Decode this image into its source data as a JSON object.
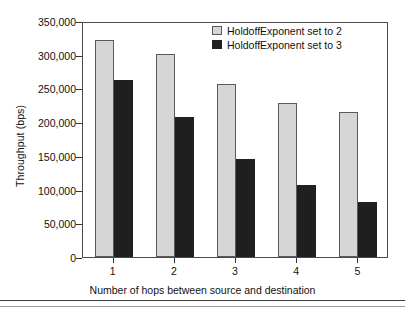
{
  "chart_data": {
    "type": "bar",
    "title": "",
    "xlabel": "Number of hops between source and destination",
    "ylabel": "Throughput (bps)",
    "categories": [
      "1",
      "2",
      "3",
      "4",
      "5"
    ],
    "ylim": [
      0,
      350000
    ],
    "ytick_labels": [
      "0",
      "50,000",
      "100,000",
      "150,000",
      "200,000",
      "250,000",
      "300,000",
      "350,000"
    ],
    "ytick_values": [
      0,
      50000,
      100000,
      150000,
      200000,
      250000,
      300000,
      350000
    ],
    "grid": false,
    "legend_position": "top-right-inside",
    "series": [
      {
        "name": "HoldoffExponent set to 2",
        "color": "#d6d6d6",
        "values": [
          322000,
          301000,
          257000,
          228000,
          215000
        ]
      },
      {
        "name": "HoldoffExponent set to 3",
        "color": "#1f1f1f",
        "values": [
          263000,
          207000,
          145000,
          107000,
          82000
        ]
      }
    ]
  },
  "legend": {
    "items": [
      {
        "label": "HoldoffExponent set to 2",
        "swatch": "light-swatch-icon"
      },
      {
        "label": "HoldoffExponent set to 3",
        "swatch": "dark-swatch-icon"
      }
    ]
  }
}
